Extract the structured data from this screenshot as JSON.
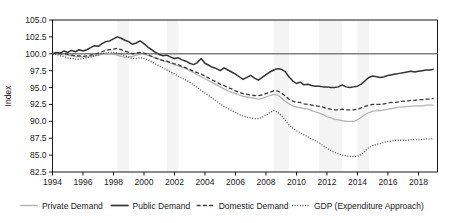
{
  "chart_data": {
    "type": "line",
    "title": "",
    "xlabel": "",
    "ylabel": "Index",
    "xlim": [
      1994.0,
      2019.25
    ],
    "ylim": [
      82.5,
      105.0
    ],
    "yticks": [
      "105.0",
      "102.5",
      "100.0",
      "97.5",
      "95.0",
      "92.5",
      "90.0",
      "87.5",
      "85.0",
      "82.5"
    ],
    "ytick_values": [
      105.0,
      102.5,
      100.0,
      97.5,
      95.0,
      92.5,
      90.0,
      87.5,
      85.0,
      82.5
    ],
    "xticks": [
      "1994",
      "1996",
      "1998",
      "2000",
      "2002",
      "2004",
      "2006",
      "2008",
      "2010",
      "2012",
      "2014",
      "2016",
      "2018"
    ],
    "xtick_values": [
      1994,
      1996,
      1998,
      2000,
      2002,
      2004,
      2006,
      2008,
      2010,
      2012,
      2014,
      2016,
      2018
    ],
    "grid": false,
    "reference_line": {
      "y": 100.0,
      "color": "#808080",
      "label": "index-100-reference"
    },
    "legend_position": "bottom",
    "shaded_bands": [
      {
        "x0": 1998.25,
        "x1": 1999.0,
        "color": "#f4f4f4"
      },
      {
        "x0": 2001.5,
        "x1": 2002.25,
        "color": "#f4f4f4"
      },
      {
        "x0": 2008.5,
        "x1": 2009.5,
        "color": "#f4f4f4"
      },
      {
        "x0": 2011.5,
        "x1": 2013.0,
        "color": "#f4f4f4"
      },
      {
        "x0": 2014.0,
        "x1": 2014.75,
        "color": "#f4f4f4"
      }
    ],
    "series": [
      {
        "name": "Private Demand",
        "color": "#b4b4b4",
        "dash": "solid",
        "width": 1.3,
        "x": [
          1994.0,
          1994.25,
          1994.5,
          1994.75,
          1995.0,
          1995.25,
          1995.5,
          1995.75,
          1996.0,
          1996.25,
          1996.5,
          1996.75,
          1997.0,
          1997.25,
          1997.5,
          1997.75,
          1998.0,
          1998.25,
          1998.5,
          1998.75,
          1999.0,
          1999.25,
          1999.5,
          1999.75,
          2000.0,
          2000.25,
          2000.5,
          2000.75,
          2001.0,
          2001.25,
          2001.5,
          2001.75,
          2002.0,
          2002.25,
          2002.5,
          2002.75,
          2003.0,
          2003.25,
          2003.5,
          2003.75,
          2004.0,
          2004.25,
          2004.5,
          2004.75,
          2005.0,
          2005.25,
          2005.5,
          2005.75,
          2006.0,
          2006.25,
          2006.5,
          2006.75,
          2007.0,
          2007.25,
          2007.5,
          2007.75,
          2008.0,
          2008.25,
          2008.5,
          2008.75,
          2009.0,
          2009.25,
          2009.5,
          2009.75,
          2010.0,
          2010.25,
          2010.5,
          2010.75,
          2011.0,
          2011.25,
          2011.5,
          2011.75,
          2012.0,
          2012.25,
          2012.5,
          2012.75,
          2013.0,
          2013.25,
          2013.5,
          2013.75,
          2014.0,
          2014.25,
          2014.5,
          2014.75,
          2015.0,
          2015.25,
          2015.5,
          2015.75,
          2016.0,
          2016.25,
          2016.5,
          2016.75,
          2017.0,
          2017.25,
          2017.5,
          2017.75,
          2018.0,
          2018.25,
          2018.5,
          2018.75,
          2019.0
        ],
        "values": [
          100.0,
          100.1,
          100.0,
          99.9,
          99.8,
          99.7,
          99.6,
          99.6,
          99.5,
          99.5,
          99.6,
          99.7,
          99.8,
          99.9,
          100.0,
          100.0,
          99.9,
          99.8,
          99.6,
          99.5,
          99.5,
          99.6,
          99.8,
          99.9,
          99.9,
          99.8,
          99.6,
          99.4,
          99.2,
          99.0,
          98.8,
          98.6,
          98.4,
          98.2,
          98.0,
          97.8,
          97.5,
          97.2,
          96.9,
          96.6,
          96.3,
          96.0,
          95.7,
          95.4,
          95.1,
          94.8,
          94.5,
          94.3,
          94.1,
          93.9,
          93.7,
          93.6,
          93.5,
          93.4,
          93.3,
          93.4,
          93.6,
          93.8,
          94.0,
          93.9,
          93.5,
          93.0,
          92.6,
          92.3,
          92.1,
          92.0,
          91.9,
          91.8,
          91.6,
          91.4,
          91.2,
          91.0,
          90.7,
          90.5,
          90.3,
          90.2,
          90.1,
          90.0,
          90.0,
          90.0,
          90.2,
          90.6,
          91.0,
          91.3,
          91.5,
          91.6,
          91.6,
          91.7,
          91.8,
          91.9,
          92.0,
          92.1,
          92.1,
          92.2,
          92.2,
          92.3,
          92.3,
          92.3,
          92.4,
          92.4,
          92.4
        ]
      },
      {
        "name": "Public Demand",
        "color": "#333333",
        "dash": "solid",
        "width": 1.5,
        "x": [
          1994.0,
          1994.25,
          1994.5,
          1994.75,
          1995.0,
          1995.25,
          1995.5,
          1995.75,
          1996.0,
          1996.25,
          1996.5,
          1996.75,
          1997.0,
          1997.25,
          1997.5,
          1997.75,
          1998.0,
          1998.25,
          1998.5,
          1998.75,
          1999.0,
          1999.25,
          1999.5,
          1999.75,
          2000.0,
          2000.25,
          2000.5,
          2000.75,
          2001.0,
          2001.25,
          2001.5,
          2001.75,
          2002.0,
          2002.25,
          2002.5,
          2002.75,
          2003.0,
          2003.25,
          2003.5,
          2003.75,
          2004.0,
          2004.25,
          2004.5,
          2004.75,
          2005.0,
          2005.25,
          2005.5,
          2005.75,
          2006.0,
          2006.25,
          2006.5,
          2006.75,
          2007.0,
          2007.25,
          2007.5,
          2007.75,
          2008.0,
          2008.25,
          2008.5,
          2008.75,
          2009.0,
          2009.25,
          2009.5,
          2009.75,
          2010.0,
          2010.25,
          2010.5,
          2010.75,
          2011.0,
          2011.25,
          2011.5,
          2011.75,
          2012.0,
          2012.25,
          2012.5,
          2012.75,
          2013.0,
          2013.25,
          2013.5,
          2013.75,
          2014.0,
          2014.25,
          2014.5,
          2014.75,
          2015.0,
          2015.25,
          2015.5,
          2015.75,
          2016.0,
          2016.25,
          2016.5,
          2016.75,
          2017.0,
          2017.25,
          2017.5,
          2017.75,
          2018.0,
          2018.25,
          2018.5,
          2018.75,
          2019.0
        ],
        "values": [
          100.0,
          100.2,
          100.1,
          100.4,
          100.2,
          100.5,
          100.3,
          100.6,
          100.4,
          100.6,
          100.9,
          101.2,
          101.1,
          101.5,
          101.8,
          101.9,
          102.2,
          102.5,
          102.3,
          102.0,
          101.8,
          101.4,
          101.6,
          101.9,
          101.5,
          101.0,
          100.6,
          100.2,
          99.9,
          99.7,
          99.8,
          99.5,
          99.3,
          99.4,
          99.1,
          98.9,
          98.6,
          98.4,
          98.7,
          99.3,
          98.6,
          98.3,
          98.0,
          97.8,
          97.5,
          97.9,
          97.6,
          97.3,
          97.0,
          96.6,
          96.2,
          96.5,
          96.8,
          96.4,
          96.1,
          96.5,
          96.9,
          97.3,
          97.6,
          97.8,
          97.7,
          97.4,
          96.6,
          96.0,
          95.6,
          95.8,
          95.4,
          95.5,
          95.3,
          95.2,
          95.2,
          95.1,
          95.1,
          95.0,
          95.0,
          95.1,
          95.4,
          95.1,
          95.0,
          95.1,
          95.2,
          95.5,
          96.0,
          96.5,
          96.7,
          96.6,
          96.5,
          96.6,
          96.8,
          96.9,
          97.0,
          97.1,
          97.2,
          97.3,
          97.4,
          97.3,
          97.4,
          97.5,
          97.6,
          97.6,
          97.7
        ]
      },
      {
        "name": "Domestic Demand",
        "color": "#3a3a3a",
        "dash": "dashed",
        "width": 1.3,
        "x": [
          1994.0,
          1994.25,
          1994.5,
          1994.75,
          1995.0,
          1995.25,
          1995.5,
          1995.75,
          1996.0,
          1996.25,
          1996.5,
          1996.75,
          1997.0,
          1997.25,
          1997.5,
          1997.75,
          1998.0,
          1998.25,
          1998.5,
          1998.75,
          1999.0,
          1999.25,
          1999.5,
          1999.75,
          2000.0,
          2000.25,
          2000.5,
          2000.75,
          2001.0,
          2001.25,
          2001.5,
          2001.75,
          2002.0,
          2002.25,
          2002.5,
          2002.75,
          2003.0,
          2003.25,
          2003.5,
          2003.75,
          2004.0,
          2004.25,
          2004.5,
          2004.75,
          2005.0,
          2005.25,
          2005.5,
          2005.75,
          2006.0,
          2006.25,
          2006.5,
          2006.75,
          2007.0,
          2007.25,
          2007.5,
          2007.75,
          2008.0,
          2008.25,
          2008.5,
          2008.75,
          2009.0,
          2009.25,
          2009.5,
          2009.75,
          2010.0,
          2010.25,
          2010.5,
          2010.75,
          2011.0,
          2011.25,
          2011.5,
          2011.75,
          2012.0,
          2012.25,
          2012.5,
          2012.75,
          2013.0,
          2013.25,
          2013.5,
          2013.75,
          2014.0,
          2014.25,
          2014.5,
          2014.75,
          2015.0,
          2015.25,
          2015.5,
          2015.75,
          2016.0,
          2016.25,
          2016.5,
          2016.75,
          2017.0,
          2017.25,
          2017.5,
          2017.75,
          2018.0,
          2018.25,
          2018.5,
          2018.75,
          2019.0
        ],
        "values": [
          100.0,
          100.1,
          100.0,
          100.0,
          99.9,
          99.8,
          99.7,
          99.7,
          99.6,
          99.7,
          99.8,
          99.9,
          100.1,
          100.3,
          100.5,
          100.6,
          100.7,
          100.8,
          100.6,
          100.4,
          100.2,
          100.0,
          100.1,
          100.2,
          100.1,
          99.9,
          99.6,
          99.4,
          99.2,
          99.0,
          98.9,
          98.7,
          98.5,
          98.4,
          98.1,
          97.9,
          97.7,
          97.4,
          97.2,
          97.0,
          96.7,
          96.4,
          96.1,
          95.8,
          95.5,
          95.3,
          95.0,
          94.8,
          94.5,
          94.3,
          94.1,
          94.0,
          93.9,
          93.8,
          93.8,
          93.9,
          94.1,
          94.3,
          94.5,
          94.5,
          94.2,
          93.8,
          93.3,
          93.0,
          92.8,
          92.8,
          92.6,
          92.5,
          92.4,
          92.3,
          92.2,
          92.1,
          91.9,
          91.8,
          91.7,
          91.7,
          91.8,
          91.7,
          91.7,
          91.7,
          91.8,
          92.0,
          92.2,
          92.4,
          92.5,
          92.5,
          92.5,
          92.6,
          92.7,
          92.8,
          92.8,
          92.9,
          93.0,
          93.0,
          93.1,
          93.1,
          93.2,
          93.2,
          93.3,
          93.3,
          93.4
        ]
      },
      {
        "name": "GDP (Expenditure Approach)",
        "color": "#4a4a4a",
        "dash": "dotted",
        "width": 1.3,
        "x": [
          1994.0,
          1994.25,
          1994.5,
          1994.75,
          1995.0,
          1995.25,
          1995.5,
          1995.75,
          1996.0,
          1996.25,
          1996.5,
          1996.75,
          1997.0,
          1997.25,
          1997.5,
          1997.75,
          1998.0,
          1998.25,
          1998.5,
          1998.75,
          1999.0,
          1999.25,
          1999.5,
          1999.75,
          2000.0,
          2000.25,
          2000.5,
          2000.75,
          2001.0,
          2001.25,
          2001.5,
          2001.75,
          2002.0,
          2002.25,
          2002.5,
          2002.75,
          2003.0,
          2003.25,
          2003.5,
          2003.75,
          2004.0,
          2004.25,
          2004.5,
          2004.75,
          2005.0,
          2005.25,
          2005.5,
          2005.75,
          2006.0,
          2006.25,
          2006.5,
          2006.75,
          2007.0,
          2007.25,
          2007.5,
          2007.75,
          2008.0,
          2008.25,
          2008.5,
          2008.75,
          2009.0,
          2009.25,
          2009.5,
          2009.75,
          2010.0,
          2010.25,
          2010.5,
          2010.75,
          2011.0,
          2011.25,
          2011.5,
          2011.75,
          2012.0,
          2012.25,
          2012.5,
          2012.75,
          2013.0,
          2013.25,
          2013.5,
          2013.75,
          2014.0,
          2014.25,
          2014.5,
          2014.75,
          2015.0,
          2015.25,
          2015.5,
          2015.75,
          2016.0,
          2016.25,
          2016.5,
          2016.75,
          2017.0,
          2017.25,
          2017.5,
          2017.75,
          2018.0,
          2018.25,
          2018.5,
          2018.75,
          2019.0
        ],
        "values": [
          100.0,
          99.9,
          99.7,
          99.6,
          99.4,
          99.3,
          99.2,
          99.2,
          99.3,
          99.4,
          99.5,
          99.7,
          99.8,
          100.0,
          100.1,
          100.2,
          100.2,
          100.1,
          99.9,
          99.7,
          99.5,
          99.3,
          99.3,
          99.4,
          99.3,
          99.1,
          98.8,
          98.5,
          98.2,
          97.9,
          97.6,
          97.3,
          97.0,
          96.7,
          96.4,
          96.1,
          95.8,
          95.4,
          95.0,
          94.6,
          94.2,
          93.8,
          93.4,
          93.0,
          92.6,
          92.2,
          91.9,
          91.6,
          91.3,
          91.0,
          90.8,
          90.6,
          90.5,
          90.4,
          90.4,
          90.6,
          90.9,
          91.3,
          91.6,
          91.4,
          90.9,
          90.2,
          89.5,
          89.0,
          88.6,
          88.3,
          88.0,
          87.7,
          87.4,
          87.1,
          86.8,
          86.4,
          86.0,
          85.7,
          85.4,
          85.2,
          85.0,
          84.9,
          84.8,
          84.8,
          84.8,
          85.1,
          85.6,
          86.1,
          86.4,
          86.6,
          86.7,
          86.9,
          87.0,
          87.1,
          87.2,
          87.2,
          87.2,
          87.2,
          87.3,
          87.3,
          87.3,
          87.3,
          87.4,
          87.4,
          87.4
        ]
      }
    ]
  },
  "legend": {
    "items": [
      {
        "label": "Private Demand"
      },
      {
        "label": "Public Demand"
      },
      {
        "label": "Domestic Demand"
      },
      {
        "label": "GDP (Expenditure Approach)"
      }
    ]
  }
}
